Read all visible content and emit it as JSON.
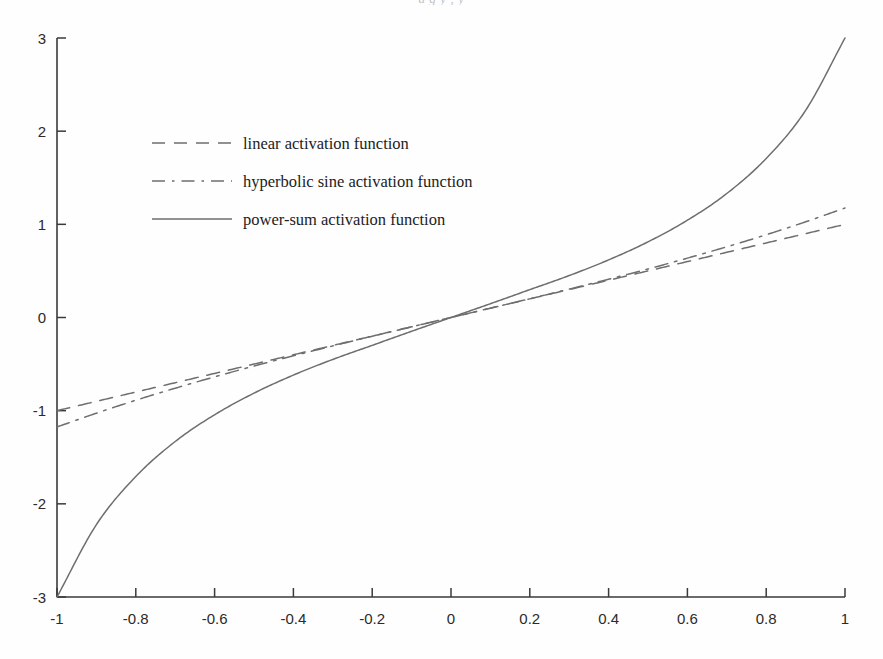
{
  "figure": {
    "clipped_title": "a g y    ,    y",
    "background_color": "#fefefe",
    "axis_color": "#3a3a3a",
    "text_color": "#2b2b2b",
    "curve_color": "#6e6e6e"
  },
  "chart_data": {
    "type": "line",
    "title": "",
    "xlabel": "",
    "ylabel": "",
    "xlim": [
      -1,
      1
    ],
    "ylim": [
      -3,
      3
    ],
    "grid": false,
    "legend_position": "upper-left",
    "xticks": [
      -1,
      -0.8,
      -0.6,
      -0.4,
      -0.2,
      0,
      0.2,
      0.4,
      0.6,
      0.8,
      1
    ],
    "xtick_labels": [
      "-1",
      "-0.8",
      "-0.6",
      "-0.4",
      "-0.2",
      "0",
      "0.2",
      "0.4",
      "0.6",
      "0.8",
      "1"
    ],
    "yticks": [
      -3,
      -2,
      -1,
      0,
      1,
      2,
      3
    ],
    "ytick_labels": [
      "-3",
      "-2",
      "-1",
      "0",
      "1",
      "2",
      "3"
    ],
    "x": [
      -1,
      -0.9,
      -0.8,
      -0.7,
      -0.6,
      -0.5,
      -0.4,
      -0.3,
      -0.2,
      -0.1,
      0,
      0.1,
      0.2,
      0.3,
      0.4,
      0.5,
      0.6,
      0.7,
      0.8,
      0.9,
      1
    ],
    "series": [
      {
        "name": "linear activation function",
        "style": "dashed",
        "color": "#6e6e6e",
        "values": [
          -1,
          -0.9,
          -0.8,
          -0.7,
          -0.6,
          -0.5,
          -0.4,
          -0.3,
          -0.2,
          -0.1,
          0,
          0.1,
          0.2,
          0.3,
          0.4,
          0.5,
          0.6,
          0.7,
          0.8,
          0.9,
          1
        ]
      },
      {
        "name": "hyperbolic sine activation function",
        "style": "dash-dot",
        "color": "#6e6e6e",
        "values": [
          -1.175,
          -1.027,
          -0.888,
          -0.759,
          -0.637,
          -0.521,
          -0.411,
          -0.305,
          -0.201,
          -0.1,
          0,
          0.1,
          0.201,
          0.305,
          0.411,
          0.521,
          0.637,
          0.759,
          0.888,
          1.027,
          1.175
        ]
      },
      {
        "name": "power-sum activation function",
        "style": "solid",
        "color": "#6e6e6e",
        "values": [
          -3,
          -2.223,
          -1.707,
          -1.331,
          -1.044,
          -0.812,
          -0.618,
          -0.45,
          -0.299,
          -0.148,
          0,
          0.148,
          0.299,
          0.45,
          0.618,
          0.812,
          1.044,
          1.331,
          1.707,
          2.223,
          3
        ]
      }
    ],
    "legend": [
      {
        "label": "linear activation function",
        "style": "dashed"
      },
      {
        "label": "hyperbolic sine activation function",
        "style": "dash-dot"
      },
      {
        "label": "power-sum activation function",
        "style": "solid"
      }
    ]
  }
}
